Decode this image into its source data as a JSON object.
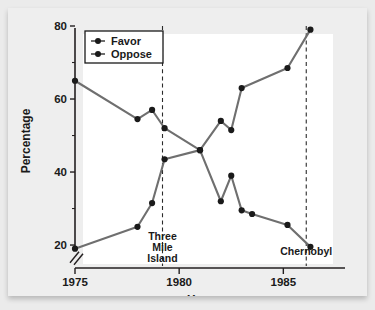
{
  "chart_data": {
    "type": "line",
    "title": "",
    "xlabel": "Year",
    "ylabel": "Percentage",
    "xlim": [
      1975,
      1987
    ],
    "ylim": [
      17,
      80
    ],
    "grid": false,
    "legend_position": "top-left",
    "x_ticks": [
      "1975",
      "1980",
      "1985"
    ],
    "x_tick_values": [
      1975,
      1980,
      1985
    ],
    "y_ticks": [
      "20",
      "40",
      "60",
      "80"
    ],
    "y_tick_values": [
      20,
      40,
      60,
      80
    ],
    "y_minor_ticks": [
      30,
      50,
      70
    ],
    "axis_break": true,
    "series": [
      {
        "name": "Favor",
        "color": "#6f6f6f",
        "marker": "circle",
        "x": [
          1975,
          1978,
          1978.7,
          1979.3,
          1981,
          1982,
          1982.5,
          1983,
          1985.2,
          1986.3
        ],
        "values": [
          65,
          54.5,
          57,
          52,
          46,
          54,
          51.5,
          63,
          68.5,
          79
        ]
      },
      {
        "name": "Oppose",
        "color": "#6f6f6f",
        "marker": "circle",
        "x": [
          1975,
          1978,
          1978.7,
          1979.3,
          1981,
          1982,
          1982.5,
          1983,
          1983.5,
          1985.2,
          1986.3
        ],
        "values": [
          19,
          25,
          31.5,
          43.5,
          46,
          32,
          39,
          29.5,
          28.5,
          25.5,
          19.5
        ]
      }
    ],
    "annotations": [
      {
        "label": "Three Mile Island",
        "lines": [
          "Three",
          "Mile",
          "Island"
        ],
        "x": 1979.2,
        "type": "vertical-dashed-line"
      },
      {
        "label": "Chernobyl",
        "lines": [
          "Chernobyl"
        ],
        "x": 1986.1,
        "type": "vertical-dashed-line"
      }
    ]
  },
  "legend": {
    "items": [
      {
        "label": "Favor"
      },
      {
        "label": "Oppose"
      }
    ]
  },
  "axes": {
    "x_title": "Year",
    "y_title": "Percentage"
  },
  "colors": {
    "line": "#6f6f6f",
    "marker": "#1a1a1a",
    "axis": "#231f20",
    "panel_background": "#ffffff",
    "figure_background": "#ebebeb"
  }
}
